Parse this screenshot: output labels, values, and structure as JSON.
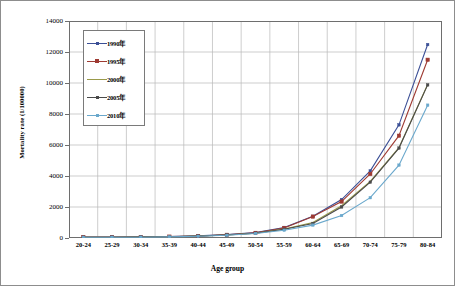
{
  "chart_data": {
    "type": "line",
    "title": "",
    "xlabel": "Age group",
    "ylabel": "Mortality rate (1/100000)",
    "categories": [
      "20-24",
      "25-29",
      "30-34",
      "35-39",
      "40-44",
      "45-49",
      "50-54",
      "55-59",
      "60-64",
      "65-69",
      "70-74",
      "75-79",
      "80-84"
    ],
    "ylim": [
      0,
      14000
    ],
    "yticks": [
      0,
      2000,
      4000,
      6000,
      8000,
      10000,
      12000,
      14000
    ],
    "ytick_labels": [
      "0",
      "2000",
      "4000",
      "6000",
      "8000",
      "10000",
      "12000",
      "14000"
    ],
    "grid": true,
    "legend_position": "upper-left-inside",
    "series": [
      {
        "name": "1990年",
        "color": "#3b4f96",
        "marker": "dot",
        "values": [
          60,
          60,
          70,
          95,
          140,
          215,
          345,
          680,
          1400,
          2480,
          4330,
          7300,
          12480
        ]
      },
      {
        "name": "1995年",
        "color": "#9e3a32",
        "marker": "square",
        "values": [
          55,
          55,
          65,
          90,
          130,
          205,
          330,
          650,
          1380,
          2350,
          4130,
          6600,
          11500
        ]
      },
      {
        "name": "2000年",
        "color": "#9a9a4a",
        "marker": "none",
        "values": [
          50,
          50,
          60,
          85,
          125,
          195,
          310,
          570,
          1000,
          2080,
          3650,
          5830,
          9900
        ]
      },
      {
        "name": "2005年",
        "color": "#4a4a4a",
        "marker": "dot",
        "values": [
          50,
          50,
          58,
          82,
          120,
          190,
          305,
          560,
          940,
          2000,
          3600,
          5800,
          9880
        ]
      },
      {
        "name": "2010年",
        "color": "#6aa8cc",
        "marker": "dot",
        "values": [
          45,
          45,
          52,
          75,
          110,
          175,
          290,
          500,
          830,
          1450,
          2600,
          4700,
          8570
        ]
      }
    ]
  }
}
